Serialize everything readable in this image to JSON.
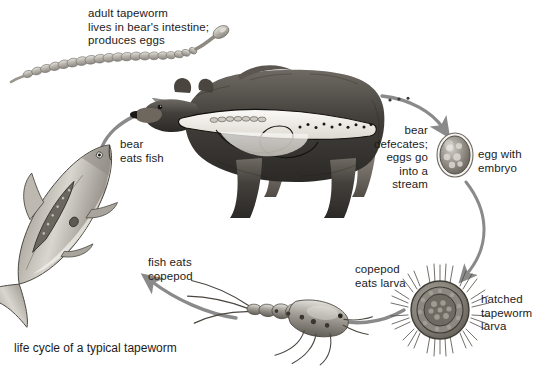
{
  "diagram": {
    "caption": "life cycle of a typical tapeworm",
    "background_color": "#ffffff",
    "text_color": "#1c1c1c",
    "arrow_color": "#8a8a8a"
  },
  "labels": {
    "adult_tapeworm": "adult tapeworm\nlives in bear's intestine;\nproduces eggs",
    "bear_eats_fish": "bear\neats fish",
    "bear_defecates": "bear\ndefecates;\neggs go\ninto a\nstream",
    "egg_with_embryo": "egg with\nembryo",
    "hatched_larva": "hatched\ntapeworm\nlarva",
    "copepod_eats_larva": "copepod\neats larva",
    "fish_eats_copepod": "fish eats\ncopepod"
  },
  "organisms": {
    "tapeworm": "adult-tapeworm",
    "bear": "bear",
    "fish": "fish",
    "copepod": "copepod",
    "egg": "egg-with-embryo",
    "larva": "hatched-tapeworm-larva"
  },
  "arrows": [
    {
      "name": "arrow-bear-eats-fish",
      "from": "fish",
      "to": "bear"
    },
    {
      "name": "arrow-bear-defecates",
      "from": "bear",
      "to": "egg"
    },
    {
      "name": "arrow-egg-to-larva",
      "from": "egg",
      "to": "larva"
    },
    {
      "name": "arrow-copepod-eats-larva",
      "from": "larva",
      "to": "copepod"
    },
    {
      "name": "arrow-fish-eats-copepod",
      "from": "copepod",
      "to": "fish"
    }
  ]
}
